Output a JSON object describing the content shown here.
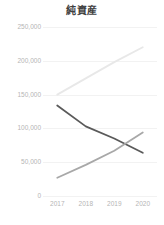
{
  "chart_data": {
    "type": "line",
    "title": "純資産",
    "xlabel": "",
    "ylabel": "",
    "categories": [
      "2017",
      "2018",
      "2019",
      "2020"
    ],
    "x": [
      2017,
      2018,
      2019,
      2020
    ],
    "ylim": [
      0,
      250000
    ],
    "ytick_labels": [
      "250,000",
      "200,000",
      "150,000",
      "100,000",
      "50,000",
      "0"
    ],
    "ytick_values": [
      250000,
      200000,
      150000,
      100000,
      50000,
      0
    ],
    "grid": true,
    "legend": "none",
    "series": [
      {
        "name": "series-light",
        "color": "#e8e8e8",
        "values": [
          150000,
          174000,
          198000,
          220000
        ]
      },
      {
        "name": "series-dark",
        "color": "#5a5a5a",
        "values": [
          134000,
          103000,
          85000,
          64000
        ]
      },
      {
        "name": "series-medium",
        "color": "#a8a8a8",
        "values": [
          27000,
          46000,
          67000,
          94000
        ]
      }
    ]
  },
  "chart": {
    "title": "純資産"
  }
}
